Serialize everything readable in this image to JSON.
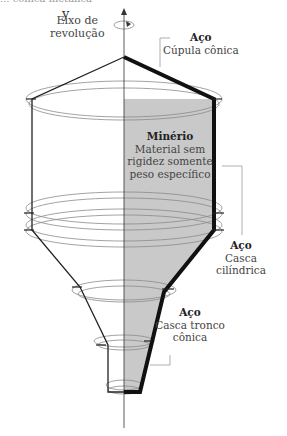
{
  "diagram": {
    "title_cutoff": "... cônica metálica",
    "axis": {
      "symbol": "y",
      "label_line1": "Eixo de",
      "label_line2": "revolução"
    },
    "labels": {
      "dome": {
        "material": "Aço",
        "part": "Cúpula cônica"
      },
      "ore": {
        "title": "Minério",
        "line1": "Material sem",
        "line2": "rigidez somente",
        "line3": "peso específico"
      },
      "cylinder": {
        "material": "Aço",
        "line1": "Casca",
        "line2": "cilíndrica"
      },
      "cone": {
        "material": "Aço",
        "line1": "Casca tronco",
        "line2": "cônica"
      }
    },
    "colors": {
      "stroke": "#1a1a1a",
      "fill_ore": "#c8c8c8",
      "ring": "#8a8a8a",
      "leader": "#999999"
    }
  }
}
